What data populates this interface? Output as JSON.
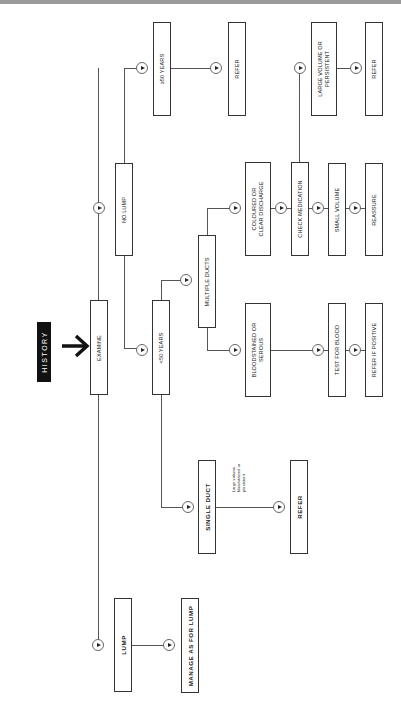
{
  "header": {
    "start_label": "HISTORY"
  },
  "nodes": {
    "examine": "EXAMINE",
    "no_lump": "NO LUMP",
    "lump": "LUMP",
    "manage_as_for_lump": "MANAGE AS FOR LUMP",
    "under_50": "<50 YEARS",
    "over_50": "≥50 YEARS",
    "refer_over_50": "REFER",
    "multiple_ducts": "MULTIPLE DUCTS",
    "single_duct": "SINGLE DUCT",
    "refer_single_duct": "REFER",
    "coloured_or_clear": "COLOURED OR\nCLEAR DISCHARGE",
    "bloodstained_or_serous": "BLOODSTAINED OR\nSEROUS",
    "check_medication": "CHECK MEDICATION",
    "small_volume": "SMALL VOLUME",
    "reassure": "REASSURE",
    "large_volume_or_persistent": "LARGE VOLUME OR\nPERSISTENT",
    "refer_large_volume": "REFER",
    "test_for_blood": "TEST FOR BLOOD",
    "refer_if_positive": "REFER IF POSITIVE"
  },
  "annotations": {
    "single_duct_condition": "Large volume,\nbloodstained or\npersistent"
  },
  "icons": {
    "connector": "play-circle-icon",
    "start_arrow": "arrow-right-icon"
  },
  "colors": {
    "line": "#555555",
    "box_border": "#333333",
    "label_bg": "#111111",
    "label_text": "#ffffff"
  }
}
